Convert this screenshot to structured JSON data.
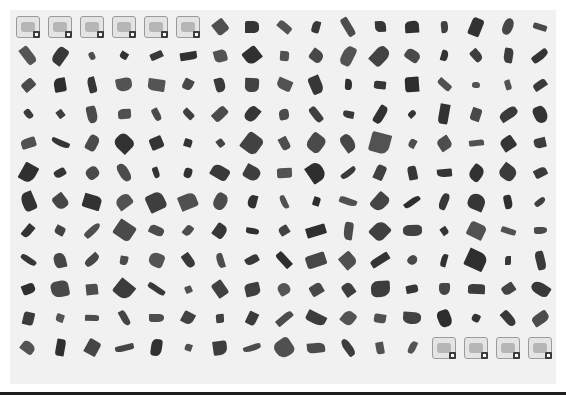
{
  "palette": {
    "columns": 17,
    "rows": 12,
    "background": "#f1f1f1",
    "part_color": "#3d3d3d",
    "top_category_buttons": [
      {
        "icon": "gear-wheel-icon"
      },
      {
        "icon": "axle-connector-icon"
      },
      {
        "icon": "cylinder-pipe-icon"
      },
      {
        "icon": "plate-brick-icon"
      },
      {
        "icon": "wrench-tool-icon"
      },
      {
        "icon": "slope-brick-icon"
      }
    ],
    "bottom_category_buttons": [
      {
        "icon": "torso-armor-icon"
      },
      {
        "icon": "feather-wing-icon"
      },
      {
        "icon": "flower-plant-icon"
      },
      {
        "icon": "decorated-piece-icon"
      }
    ],
    "part_tiles_count": 194
  }
}
